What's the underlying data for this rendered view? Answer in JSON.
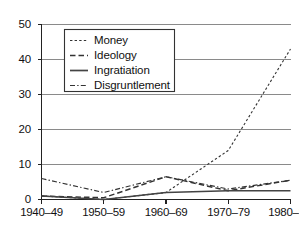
{
  "chart_data": {
    "type": "line",
    "title": "",
    "subtitle": "",
    "xlabel": "",
    "ylabel": "",
    "categories": [
      "1940–49",
      "1950–59",
      "1960–69",
      "1970–79",
      "1980–89"
    ],
    "ylim": [
      0,
      50
    ],
    "yticks": [
      0,
      10,
      20,
      30,
      40,
      50
    ],
    "ytick_labels": [
      "0",
      "10",
      "20",
      "30",
      "40",
      "50"
    ],
    "grid": "horizontal",
    "legend_position": "upper-left-inset",
    "series": [
      {
        "name": "Money",
        "style": "dotted",
        "color": "#333333",
        "values": [
          1,
          0,
          2,
          14,
          43
        ]
      },
      {
        "name": "Ideology",
        "style": "dashed",
        "color": "#333333",
        "values": [
          1,
          0.5,
          6.5,
          2.5,
          5.5
        ]
      },
      {
        "name": "Ingratiation",
        "style": "solid",
        "color": "#333333",
        "values": [
          1,
          0,
          2,
          2.5,
          2.5
        ]
      },
      {
        "name": "Disgruntlement",
        "style": "dashdot",
        "color": "#333333",
        "values": [
          6,
          2,
          6.5,
          3,
          5.5
        ]
      }
    ]
  },
  "axes": {
    "y_tick_0": "0",
    "y_tick_1": "10",
    "y_tick_2": "20",
    "y_tick_3": "30",
    "y_tick_4": "40",
    "y_tick_5": "50",
    "x_tick_0": "1940–49",
    "x_tick_1": "1950–59",
    "x_tick_2": "1960–69",
    "x_tick_3": "1970–79",
    "x_tick_4": "1980–89"
  },
  "legend": {
    "item_0": "Money",
    "item_1": "Ideology",
    "item_2": "Ingratiation",
    "item_3": "Disgruntlement"
  },
  "colors": {
    "line": "#333333",
    "grid": "#8a8a8a",
    "axis": "#222222",
    "background": "#ffffff"
  }
}
